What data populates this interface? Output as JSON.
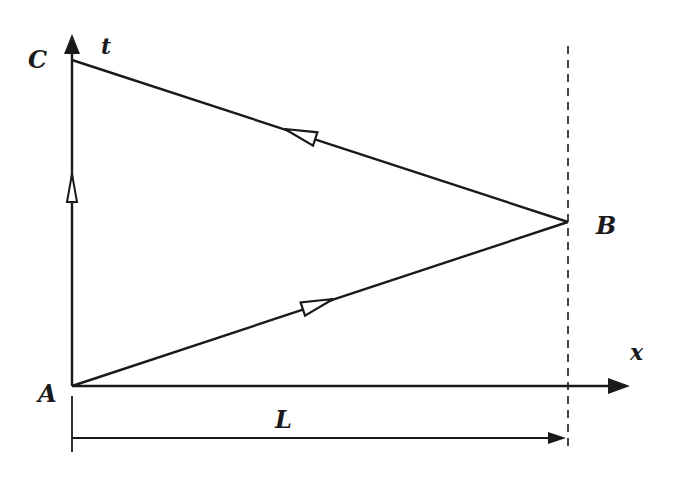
{
  "diagram": {
    "type": "spacetime-diagram",
    "axes": {
      "vertical_label": "t",
      "horizontal_label": "x"
    },
    "points": {
      "origin": "A",
      "turnaround": "B",
      "return": "C"
    },
    "dimension": {
      "label": "L"
    },
    "colors": {
      "ink": "#1a1a1a",
      "background": "#ffffff"
    }
  }
}
